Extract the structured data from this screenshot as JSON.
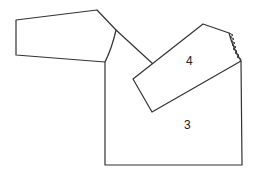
{
  "diagram": {
    "title": "",
    "pieces": [
      {
        "id": "sleeve",
        "label": ""
      },
      {
        "id": "piece-4",
        "label": "4"
      },
      {
        "id": "piece-3",
        "label": "3"
      }
    ],
    "stitch_edge": "zigzag seam on piece 4 upper-right edge",
    "colors": {
      "line": "#333333",
      "background": "#ffffff"
    }
  }
}
